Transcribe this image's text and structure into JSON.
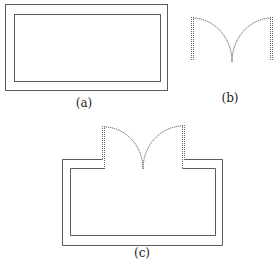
{
  "figure": {
    "panels": [
      {
        "id": "a",
        "label": "(a)",
        "description": "Double-walled rectangular room outline"
      },
      {
        "id": "b",
        "label": "(b)",
        "description": "Double door symbol: two jambs with quarter-circle swing arcs meeting at center"
      },
      {
        "id": "c",
        "label": "(c)",
        "description": "Room outline with double door inserted into top wall"
      }
    ],
    "colors": {
      "line": "#5a5a5a",
      "background": "#ffffff"
    }
  }
}
